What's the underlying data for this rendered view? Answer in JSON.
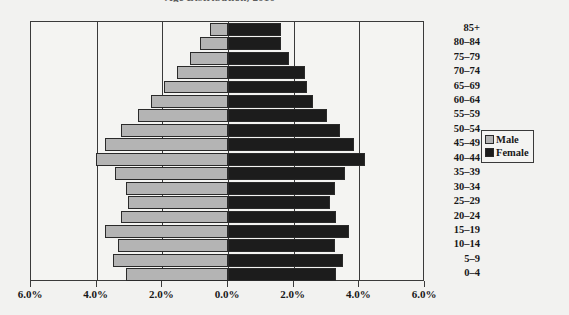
{
  "chart_data": {
    "type": "bar",
    "subtype": "population-pyramid",
    "title": "Age Distribution, 2010",
    "xlabel": "",
    "ylabel": "",
    "orientation": "horizontal",
    "grid": true,
    "legend_position": "right",
    "axis_max_percent": 6.0,
    "xlim": [
      -6.0,
      6.0
    ],
    "x_tick_labels": [
      "6.0%",
      "4.0%",
      "2.0%",
      "0.0%",
      "2.0%",
      "4.0%",
      "6.0%"
    ],
    "x_tick_values": [
      -6.0,
      -4.0,
      -2.0,
      0.0,
      2.0,
      4.0,
      6.0
    ],
    "categories": [
      "85+",
      "80–84",
      "75–79",
      "70–74",
      "65–69",
      "60–64",
      "55–59",
      "50–54",
      "45–49",
      "40–44",
      "35–39",
      "30–34",
      "25–29",
      "20–24",
      "15–19",
      "10–14",
      "5–9",
      "0–4"
    ],
    "series": [
      {
        "name": "Male",
        "color": "#b4b4b4",
        "side": "left",
        "values": [
          0.55,
          0.85,
          1.15,
          1.55,
          1.95,
          2.35,
          2.75,
          3.25,
          3.75,
          4.02,
          3.45,
          3.1,
          3.05,
          3.25,
          3.75,
          3.35,
          3.5,
          3.1
        ]
      },
      {
        "name": "Female",
        "color": "#1c1c1c",
        "side": "right",
        "values": [
          1.6,
          1.6,
          1.85,
          2.35,
          2.4,
          2.6,
          3.0,
          3.4,
          3.85,
          4.18,
          3.55,
          3.25,
          3.1,
          3.3,
          3.7,
          3.25,
          3.5,
          3.3
        ]
      }
    ],
    "legend": [
      {
        "label": "Male",
        "color": "#b4b4b4"
      },
      {
        "label": "Female",
        "color": "#1c1c1c"
      }
    ]
  },
  "colors": {
    "male": "#b4b4b4",
    "female": "#1c1c1c",
    "axis": "#3a3a3a",
    "background": "#f2f2f0",
    "text": "#181818"
  }
}
